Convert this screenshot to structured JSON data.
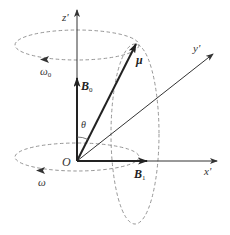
{
  "diagram": {
    "title": "",
    "colors": {
      "axis": "#333333",
      "vector": "#222222",
      "dashed": "#8a8a8a",
      "background": "#ffffff"
    },
    "axes": [
      {
        "name": "z-axis",
        "label": "z'",
        "from": [
          77,
          161
        ],
        "to": [
          77,
          8
        ]
      },
      {
        "name": "x-axis",
        "label": "x'",
        "from": [
          77,
          161
        ],
        "to": [
          217,
          161
        ]
      },
      {
        "name": "y-axis",
        "label": "y'",
        "from": [
          77,
          161
        ],
        "to": [
          213,
          54
        ]
      }
    ],
    "vectors": [
      {
        "name": "b0-vector",
        "label": "B",
        "subscript": "0",
        "from": [
          77,
          161
        ],
        "to": [
          77,
          78
        ]
      },
      {
        "name": "b1-vector",
        "label": "B",
        "subscript": "1",
        "from": [
          77,
          161
        ],
        "to": [
          147,
          161
        ]
      },
      {
        "name": "mu-vector",
        "label": "μ",
        "from": [
          77,
          161
        ],
        "to": [
          136,
          44
        ]
      }
    ],
    "ellipses": [
      {
        "name": "precession-orbit-top",
        "cx": 77,
        "cy": 45,
        "rx": 62,
        "ry": 15
      },
      {
        "name": "rotation-orbit-bottom",
        "cx": 77,
        "cy": 157,
        "rx": 62,
        "ry": 14
      },
      {
        "name": "nutation-orbit-vertical",
        "cx": 135,
        "cy": 134,
        "rx": 24,
        "ry": 90
      }
    ],
    "labels": {
      "z_axis": "z'",
      "x_axis": "x'",
      "y_axis": "y'",
      "mu": "μ",
      "b0_main": "B",
      "b0_sub": "0",
      "b1_main": "B",
      "b1_sub": "1",
      "omega0_main": "ω",
      "omega0_sub": "0",
      "omega": "ω",
      "theta": "θ",
      "origin": "O"
    }
  }
}
